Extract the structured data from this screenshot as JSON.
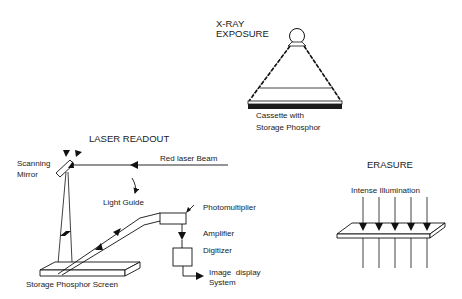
{
  "diagram": {
    "sections": {
      "xray": {
        "title_line1": "X-RAY",
        "title_line2": "EXPOSURE",
        "caption_line1": "Cassette with",
        "caption_line2": "Storage Phosphor"
      },
      "laser_readout": {
        "title": "LASER READOUT",
        "scanning_mirror_line1": "Scanning",
        "scanning_mirror_line2": "Mirror",
        "red_laser_beam": "Red laser Beam",
        "light_guide": "Light Guide",
        "photomultiplier": "Photomultiplier",
        "amplifier": "Amplifier",
        "digitizer": "Digitizer",
        "image_display_line1": "Image  display",
        "image_display_line2": "System",
        "storage_phosphor_screen": "Storage Phosphor Screen"
      },
      "erasure": {
        "title": "ERASURE",
        "illumination": "Intense Illumination"
      }
    },
    "colors": {
      "ink": "#111111",
      "background": "#ffffff"
    }
  }
}
